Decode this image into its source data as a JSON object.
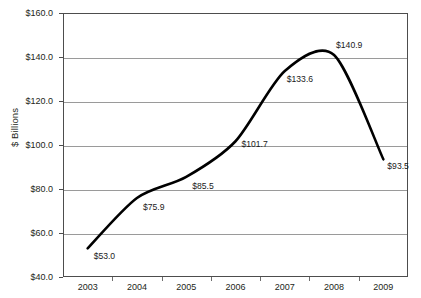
{
  "chart_data": {
    "type": "line",
    "title": "",
    "xlabel": "",
    "ylabel": "$ Billions",
    "categories": [
      "2003",
      "2004",
      "2005",
      "2006",
      "2007",
      "2008",
      "2009"
    ],
    "values": [
      53.0,
      75.9,
      85.5,
      101.7,
      133.6,
      140.9,
      93.5
    ],
    "data_labels": [
      "$53.0",
      "$75.9",
      "$85.5",
      "$101.7",
      "$133.6",
      "$140.9",
      "$93.5"
    ],
    "ylim": [
      40.0,
      160.0
    ],
    "ytick_values": [
      160.0,
      140.0,
      120.0,
      100.0,
      80.0,
      60.0,
      40.0
    ],
    "ytick_labels": [
      "$160.0",
      "$140.0",
      "$120.0",
      "$100.0",
      "$80.0",
      "$60.0",
      "$40.0"
    ],
    "grid": true,
    "grid_axis": "y",
    "legend": false,
    "series_color": "#000000",
    "gridline_color": "#9a9a9a",
    "axis_color": "#4d4d4d",
    "plot_background": "#ffffff",
    "line_style": "smooth",
    "markers": false
  },
  "axis": {
    "y_title": "$ Billions"
  }
}
